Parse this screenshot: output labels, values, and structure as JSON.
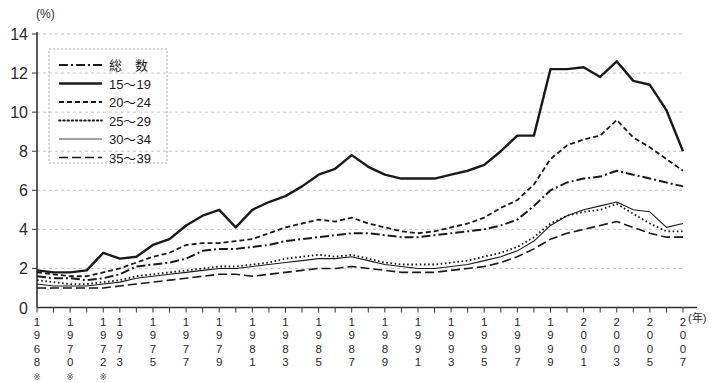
{
  "chart_data": {
    "type": "line",
    "title": "",
    "xlabel": "(年)",
    "ylabel": "(%)",
    "ylim": [
      0,
      14
    ],
    "yticks": [
      0,
      2,
      4,
      6,
      8,
      10,
      12,
      14
    ],
    "grid": true,
    "legend_position": "top-left",
    "x": [
      1968,
      1969,
      1970,
      1971,
      1972,
      1973,
      1974,
      1975,
      1976,
      1977,
      1978,
      1979,
      1980,
      1981,
      1982,
      1983,
      1984,
      1985,
      1986,
      1987,
      1988,
      1989,
      1990,
      1991,
      1992,
      1993,
      1994,
      1995,
      1996,
      1997,
      1998,
      1999,
      2000,
      2001,
      2002,
      2003,
      2004,
      2005,
      2006,
      2007
    ],
    "xtick_labels": [
      "1968",
      "1970",
      "1972",
      "1973",
      "1975",
      "1977",
      "1979",
      "1981",
      "1983",
      "1985",
      "1987",
      "1989",
      "1991",
      "1993",
      "1995",
      "1997",
      "1999",
      "2001",
      "2003",
      "2005",
      "2007"
    ],
    "xtick_years": [
      1968,
      1970,
      1972,
      1973,
      1975,
      1977,
      1979,
      1981,
      1983,
      1985,
      1987,
      1989,
      1991,
      1993,
      1995,
      1997,
      1999,
      2001,
      2003,
      2005,
      2007
    ],
    "xtick_asterisk": [
      true,
      true,
      true,
      false,
      false,
      false,
      false,
      false,
      false,
      false,
      false,
      false,
      false,
      false,
      false,
      false,
      false,
      false,
      false,
      false,
      false
    ],
    "series": [
      {
        "name": "総　数",
        "style": "dash-dot",
        "width": 2.0,
        "values": [
          1.6,
          1.5,
          1.5,
          1.4,
          1.5,
          1.7,
          2.1,
          2.2,
          2.3,
          2.5,
          2.9,
          3.0,
          3.0,
          3.1,
          3.2,
          3.4,
          3.5,
          3.6,
          3.7,
          3.8,
          3.8,
          3.7,
          3.6,
          3.6,
          3.7,
          3.8,
          3.9,
          4.0,
          4.2,
          4.5,
          5.2,
          6.0,
          6.4,
          6.6,
          6.7,
          7.0,
          6.8,
          6.6,
          6.4,
          6.2
        ]
      },
      {
        "name": "15～19",
        "style": "solid",
        "width": 2.4,
        "values": [
          1.9,
          1.8,
          1.8,
          1.9,
          2.8,
          2.5,
          2.6,
          3.2,
          3.5,
          4.2,
          4.7,
          5.0,
          4.1,
          5.0,
          5.4,
          5.7,
          6.2,
          6.8,
          7.1,
          7.8,
          7.2,
          6.8,
          6.6,
          6.6,
          6.6,
          6.8,
          7.0,
          7.3,
          8.0,
          8.8,
          8.8,
          12.2,
          12.2,
          12.3,
          11.8,
          12.6,
          11.6,
          11.4,
          10.1,
          8.0
        ]
      },
      {
        "name": "20～24",
        "style": "dashed",
        "width": 1.8,
        "values": [
          1.8,
          1.7,
          1.6,
          1.6,
          1.8,
          2.0,
          2.3,
          2.6,
          2.8,
          3.2,
          3.3,
          3.3,
          3.4,
          3.5,
          3.8,
          4.1,
          4.3,
          4.5,
          4.4,
          4.6,
          4.3,
          4.1,
          3.9,
          3.8,
          3.9,
          4.1,
          4.3,
          4.6,
          5.1,
          5.5,
          6.3,
          7.6,
          8.3,
          8.6,
          8.8,
          9.6,
          8.7,
          8.2,
          7.6,
          7.0
        ]
      },
      {
        "name": "25～29",
        "style": "dotted",
        "width": 1.8,
        "values": [
          1.4,
          1.3,
          1.2,
          1.2,
          1.3,
          1.4,
          1.6,
          1.7,
          1.8,
          1.9,
          2.0,
          2.1,
          2.1,
          2.2,
          2.3,
          2.5,
          2.6,
          2.7,
          2.6,
          2.7,
          2.5,
          2.3,
          2.2,
          2.2,
          2.2,
          2.3,
          2.4,
          2.6,
          2.8,
          3.1,
          3.6,
          4.3,
          4.7,
          4.9,
          5.0,
          5.3,
          4.8,
          4.3,
          3.9,
          3.9
        ]
      },
      {
        "name": "30～34",
        "style": "solid-thin",
        "width": 1.1,
        "values": [
          1.2,
          1.1,
          1.1,
          1.1,
          1.2,
          1.3,
          1.5,
          1.6,
          1.7,
          1.8,
          1.9,
          2.0,
          2.0,
          2.1,
          2.2,
          2.3,
          2.4,
          2.5,
          2.5,
          2.6,
          2.4,
          2.2,
          2.1,
          2.0,
          2.0,
          2.1,
          2.2,
          2.4,
          2.6,
          2.9,
          3.4,
          4.2,
          4.7,
          5.0,
          5.2,
          5.4,
          5.0,
          4.9,
          4.1,
          4.3
        ]
      },
      {
        "name": "35～39",
        "style": "long-dash",
        "width": 1.6,
        "values": [
          1.0,
          1.0,
          1.0,
          1.0,
          1.0,
          1.1,
          1.2,
          1.3,
          1.4,
          1.5,
          1.6,
          1.7,
          1.7,
          1.6,
          1.7,
          1.8,
          1.9,
          2.0,
          2.0,
          2.1,
          2.0,
          1.9,
          1.8,
          1.8,
          1.8,
          1.9,
          2.0,
          2.1,
          2.3,
          2.6,
          3.0,
          3.5,
          3.8,
          4.0,
          4.2,
          4.4,
          4.1,
          3.8,
          3.6,
          3.6
        ]
      }
    ]
  },
  "legend": {
    "items": [
      {
        "label": "総　数"
      },
      {
        "label": "15～19"
      },
      {
        "label": "20～24"
      },
      {
        "label": "25～29"
      },
      {
        "label": "30～34"
      },
      {
        "label": "35～39"
      }
    ]
  },
  "axis": {
    "y_unit": "(%)",
    "x_unit": "(年)",
    "asterisk": "※"
  }
}
